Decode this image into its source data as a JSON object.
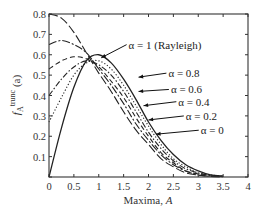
{
  "chart_data": {
    "type": "line",
    "title": "",
    "xlabel": "Maxima, A",
    "ylabel": "f_A^trunc (a)",
    "xlim": [
      0,
      4
    ],
    "ylim": [
      0,
      0.8
    ],
    "grid": false,
    "xticks": [
      "0",
      "0.5",
      "1",
      "1.5",
      "2",
      "2.5",
      "3",
      "3.5",
      "4"
    ],
    "yticks": [
      "0",
      "0.1",
      "0.2",
      "0.3",
      "0.4",
      "0.5",
      "0.6",
      "0.7",
      "0.8"
    ],
    "x": [
      0,
      0.25,
      0.5,
      0.75,
      1.0,
      1.25,
      1.5,
      1.75,
      2.0,
      2.25,
      2.5,
      2.75,
      3.0,
      3.25,
      3.5
    ],
    "series": [
      {
        "name": "α = 1 (Rayleigh)",
        "style": "solid",
        "values": [
          0.0,
          0.24,
          0.44,
          0.57,
          0.6,
          0.56,
          0.48,
          0.38,
          0.27,
          0.18,
          0.11,
          0.06,
          0.03,
          0.01,
          0.005
        ]
      },
      {
        "name": "α = 0.8",
        "style": "dotted",
        "values": [
          0.27,
          0.39,
          0.5,
          0.56,
          0.57,
          0.53,
          0.45,
          0.35,
          0.25,
          0.16,
          0.09,
          0.05,
          0.02,
          0.01,
          0.003
        ]
      },
      {
        "name": "α = 0.6",
        "style": "dashdot",
        "values": [
          0.4,
          0.48,
          0.54,
          0.57,
          0.55,
          0.5,
          0.42,
          0.32,
          0.22,
          0.14,
          0.08,
          0.04,
          0.02,
          0.007,
          0.002
        ]
      },
      {
        "name": "α = 0.4",
        "style": "dashed",
        "values": [
          0.53,
          0.57,
          0.59,
          0.58,
          0.54,
          0.47,
          0.39,
          0.29,
          0.2,
          0.12,
          0.07,
          0.03,
          0.015,
          0.005,
          0.002
        ]
      },
      {
        "name": "α = 0.2",
        "style": "dashdot2",
        "values": [
          0.65,
          0.67,
          0.65,
          0.61,
          0.53,
          0.45,
          0.36,
          0.26,
          0.18,
          0.11,
          0.06,
          0.03,
          0.01,
          0.004,
          0.001
        ]
      },
      {
        "name": "α = 0",
        "style": "longdash",
        "values": [
          0.8,
          0.78,
          0.71,
          0.61,
          0.51,
          0.42,
          0.32,
          0.23,
          0.16,
          0.09,
          0.05,
          0.02,
          0.009,
          0.003,
          0.001
        ]
      }
    ],
    "annotations": [
      {
        "text": "α = 1 (Rayleigh)",
        "x": 1.6,
        "y": 0.63,
        "arrow_to": [
          1.05,
          0.585
        ]
      },
      {
        "text": "α = 0.8",
        "x": 2.4,
        "y": 0.49,
        "arrow_to": [
          1.8,
          0.49
        ]
      },
      {
        "text": "α = 0.6",
        "x": 2.45,
        "y": 0.41,
        "arrow_to": [
          1.8,
          0.42
        ]
      },
      {
        "text": "α = 0.4",
        "x": 2.6,
        "y": 0.35,
        "arrow_to": [
          1.9,
          0.35
        ]
      },
      {
        "text": "α = 0.2",
        "x": 2.75,
        "y": 0.28,
        "arrow_to": [
          2.0,
          0.28
        ]
      },
      {
        "text": "α = 0",
        "x": 3.05,
        "y": 0.21,
        "arrow_to": [
          2.15,
          0.21
        ]
      }
    ]
  }
}
